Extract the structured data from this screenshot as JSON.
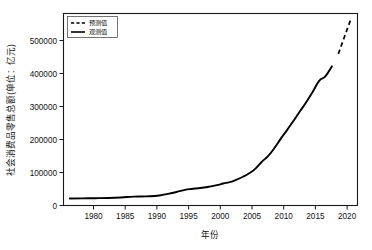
{
  "chart_data": {
    "type": "line",
    "title": "",
    "xlabel": "年份",
    "ylabel": "社会消费品零售总额(单位：亿元)",
    "xlim": [
      1977,
      2023
    ],
    "ylim": [
      -20000,
      575000
    ],
    "grid": false,
    "legend_position": "top-left",
    "x_ticks": [
      1980,
      1985,
      1990,
      1995,
      2000,
      2005,
      2010,
      2015,
      2020
    ],
    "x_tick_labels": [
      "1980",
      "1985",
      "1990",
      "1995",
      "2000",
      "2005",
      "2010",
      "2015",
      "2020"
    ],
    "y_ticks": [
      0,
      100000,
      200000,
      300000,
      400000,
      500000
    ],
    "y_tick_labels": [
      "0",
      "100000",
      "200000",
      "300000",
      "400000",
      "500000"
    ],
    "series": [
      {
        "name": "观测值",
        "style": "solid",
        "x": [
          1978,
          1980,
          1982,
          1984,
          1986,
          1988,
          1990,
          1992,
          1994,
          1995,
          1996,
          1997,
          1998,
          1999,
          2000,
          2001,
          2002,
          2003,
          2004,
          2005,
          2006,
          2007,
          2008,
          2009,
          2010,
          2011,
          2012,
          2013,
          2014,
          2015,
          2016,
          2017,
          2018,
          2019
        ],
        "values": [
          1559,
          2140,
          2570,
          3376,
          4950,
          7440,
          8300,
          10994,
          18623,
          23614,
          28360,
          31253,
          33378,
          35648,
          39106,
          43055,
          48136,
          52516,
          59501,
          68353,
          79145,
          93572,
          114830,
          133048,
          158008,
          187206,
          214433,
          242843,
          271896,
          300931,
          332316,
          366262,
          380987,
          411649
        ]
      },
      {
        "name": "预测值",
        "style": "dashed",
        "x": [
          2020,
          2021,
          2022
        ],
        "values": [
          450000,
          505000,
          560000
        ]
      }
    ]
  },
  "legend": {
    "items": [
      {
        "label": "预测值",
        "style": "dashed"
      },
      {
        "label": "观测值",
        "style": "solid"
      }
    ]
  }
}
